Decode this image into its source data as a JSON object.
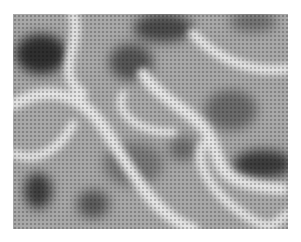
{
  "image": {
    "description": "Grayscale halftone procedural noise texture with dark blobs and light veins",
    "bounds": {
      "x": 13,
      "y": 14,
      "width": 275,
      "height": 215
    },
    "base_color": "#a8a8a8",
    "dot_pitch": 4,
    "dark_blobs": [
      {
        "cx": 28,
        "cy": 40,
        "rx": 26,
        "ry": 20,
        "shade": "#2e2e2e"
      },
      {
        "cx": 118,
        "cy": 48,
        "rx": 22,
        "ry": 18,
        "shade": "#555555"
      },
      {
        "cx": 150,
        "cy": 14,
        "rx": 30,
        "ry": 14,
        "shade": "#4a4a4a"
      },
      {
        "cx": 218,
        "cy": 96,
        "rx": 26,
        "ry": 20,
        "shade": "#6a6a6a"
      },
      {
        "cx": 250,
        "cy": 150,
        "rx": 30,
        "ry": 14,
        "shade": "#3a3a3a"
      },
      {
        "cx": 25,
        "cy": 177,
        "rx": 14,
        "ry": 18,
        "shade": "#3c3c3c"
      },
      {
        "cx": 80,
        "cy": 190,
        "rx": 16,
        "ry": 14,
        "shade": "#5a5a5a"
      },
      {
        "cx": 170,
        "cy": 135,
        "rx": 14,
        "ry": 12,
        "shade": "#6c6c6c"
      },
      {
        "cx": 240,
        "cy": 8,
        "rx": 24,
        "ry": 10,
        "shade": "#6e6e6e"
      },
      {
        "cx": 120,
        "cy": 150,
        "rx": 30,
        "ry": 22,
        "shade": "#787878"
      }
    ],
    "light_veins": [
      {
        "d": "M 0 90 C 40 70, 70 80, 95 120 S 140 200, 180 215",
        "width": 12
      },
      {
        "d": "M 60 0 C 70 30, 40 60, 70 80",
        "width": 10
      },
      {
        "d": "M 130 60 C 150 90, 190 100, 200 130 S 210 170, 270 175",
        "width": 12
      },
      {
        "d": "M 180 20 C 200 40, 230 60, 275 55",
        "width": 10
      },
      {
        "d": "M 0 140 C 30 150, 50 130, 60 110",
        "width": 9
      },
      {
        "d": "M 190 130 C 180 150, 200 180, 230 200 S 260 210, 275 200",
        "width": 9
      },
      {
        "d": "M 110 80 C 100 100, 130 120, 160 118",
        "width": 8
      }
    ]
  }
}
